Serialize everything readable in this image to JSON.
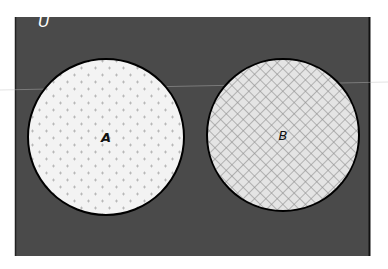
{
  "diagram": {
    "type": "venn",
    "universe_label": "U",
    "sets": [
      {
        "label": "A",
        "fill_pattern": "dotted-plus",
        "fill_color": "#f2f2f2"
      },
      {
        "label": "B",
        "fill_pattern": "crosshatch",
        "fill_color": "#e6e6e6"
      }
    ],
    "colors": {
      "universe": "#4a4a4a",
      "outline": "#000000",
      "pattern_A": "#a8a8a8",
      "pattern_B": "#8c8c8c"
    },
    "relationship": "disjoint"
  }
}
